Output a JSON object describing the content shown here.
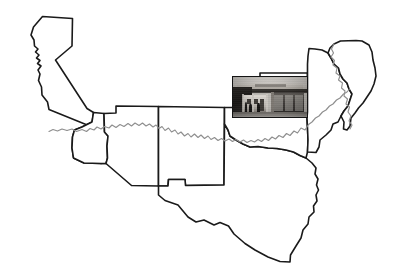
{
  "figure": {
    "background_color": "#ffffff",
    "state_outline_color": "#1a1a1a",
    "route_line_color": "#8f8f8f",
    "photo_border_color": "#141414",
    "width_px": 401,
    "height_px": 277
  },
  "map": {
    "name": "route-66-states-map",
    "states": [
      {
        "id": "california",
        "label": "California"
      },
      {
        "id": "nevada",
        "label": "Nevada"
      },
      {
        "id": "arizona",
        "label": "Arizona"
      },
      {
        "id": "new-mexico",
        "label": "New Mexico"
      },
      {
        "id": "texas",
        "label": "Texas"
      },
      {
        "id": "oklahoma",
        "label": "Oklahoma"
      },
      {
        "id": "kansas",
        "label": "Kansas"
      },
      {
        "id": "missouri",
        "label": "Missouri"
      },
      {
        "id": "illinois",
        "label": "Illinois"
      }
    ],
    "overlays": [
      {
        "id": "route-line",
        "label": "Route 66 highway line",
        "color": "#8f8f8f"
      },
      {
        "id": "mississippi-river",
        "label": "Mississippi River boundary",
        "color": "#8f8f8f"
      }
    ]
  },
  "photo": {
    "name": "historic-storefront-photo",
    "caption": "Black and white photograph of an old wooden storefront with porch",
    "alt": "Vintage monochrome photo of a roadside general store building",
    "border_color": "#141414",
    "position": {
      "left_px": 232,
      "top_px": 76,
      "width_px": 76,
      "height_px": 42
    }
  }
}
